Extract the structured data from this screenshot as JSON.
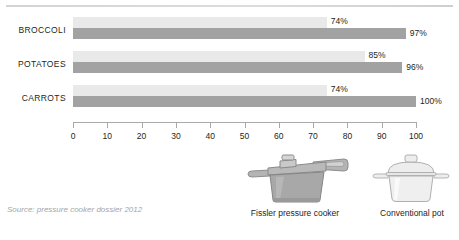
{
  "source_note": "Source: pressure cooker dossier 2012",
  "chart_data": {
    "type": "bar",
    "orientation": "horizontal",
    "title": "",
    "xlabel": "",
    "ylabel": "",
    "xlim": [
      0,
      100
    ],
    "grid": false,
    "legend_position": "bottom",
    "categories": [
      "BROCCOLI",
      "POTATOES",
      "CARROTS"
    ],
    "series": [
      {
        "name": "Fissler pressure cooker",
        "color": "#e9e9e9",
        "values": [
          74,
          85,
          74
        ],
        "labels": [
          "74%",
          "85%",
          "74%"
        ]
      },
      {
        "name": "Conventional pot",
        "color": "#a2a2a2",
        "values": [
          97,
          96,
          100
        ],
        "labels": [
          "97%",
          "96%",
          "100%"
        ]
      }
    ],
    "ticks": [
      0,
      10,
      20,
      30,
      40,
      50,
      60,
      70,
      80,
      90,
      100
    ],
    "tick_labels": [
      "0",
      "10",
      "20",
      "30",
      "40",
      "50",
      "60",
      "70",
      "80",
      "90",
      "100"
    ]
  },
  "legend": {
    "items": [
      {
        "label": "Fissler pressure cooker",
        "icon": "pressure-cooker-icon"
      },
      {
        "label": "Conventional pot",
        "icon": "cooking-pot-icon"
      }
    ]
  },
  "colors": {
    "bar_light": "#e9e9e9",
    "bar_dark": "#a2a2a2",
    "axis": "#a9a9a9",
    "text": "#231f20",
    "source_text": "#a5a5a7",
    "rule": "#d8d8da"
  }
}
